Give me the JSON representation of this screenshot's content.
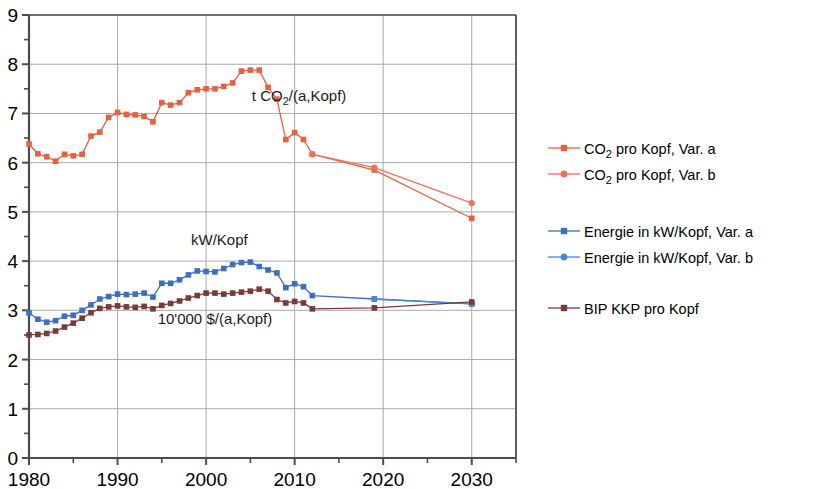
{
  "chart_data": {
    "type": "line",
    "title": "",
    "xlabel": "",
    "ylabel": "",
    "xlim": [
      1980,
      2035
    ],
    "ylim": [
      0,
      9
    ],
    "grid": true,
    "legend_position": "right",
    "x_ticks": [
      1980,
      1990,
      2000,
      2010,
      2020,
      2030
    ],
    "x_tick_labels": [
      "1980",
      "1990",
      "2000",
      "2010",
      "2020",
      "2030"
    ],
    "x_minor_ticks": [
      1985,
      1995,
      2005,
      2015,
      2025,
      2035
    ],
    "y_ticks": [
      0,
      1,
      2,
      3,
      4,
      5,
      6,
      7,
      8,
      9
    ],
    "y_tick_labels": [
      "0",
      "1",
      "2",
      "3",
      "4",
      "5",
      "6",
      "7",
      "8",
      "9"
    ],
    "y_minor_ticks": [
      0.5,
      1.5,
      2.5,
      3.5,
      4.5,
      5.5,
      6.5,
      7.5,
      8.5
    ],
    "annotations": [
      {
        "text": "t CO2/(a,Kopf)",
        "html": "t CO<sub>2</sub>/(a,Kopf)",
        "x": 2010.5,
        "y": 7.25
      },
      {
        "text": "kW/Kopf",
        "x": 2001.5,
        "y": 4.33
      },
      {
        "text": "10'000 $/(a,Kopf)",
        "x": 2001.0,
        "y": 2.72
      }
    ],
    "series": [
      {
        "name": "CO2 pro Kopf, Var. a",
        "color": "#e8603c",
        "marker": "square",
        "x": [
          1980,
          1981,
          1982,
          1983,
          1984,
          1985,
          1986,
          1987,
          1988,
          1989,
          1990,
          1991,
          1992,
          1993,
          1994,
          1995,
          1996,
          1997,
          1998,
          1999,
          2000,
          2001,
          2002,
          2003,
          2004,
          2005,
          2006,
          2007,
          2008,
          2009,
          2010,
          2011,
          2012,
          2019,
          2030
        ],
        "values": [
          6.38,
          6.18,
          6.12,
          6.03,
          6.17,
          6.14,
          6.17,
          6.54,
          6.62,
          6.92,
          7.02,
          6.98,
          6.97,
          6.94,
          6.83,
          7.22,
          7.17,
          7.22,
          7.42,
          7.48,
          7.5,
          7.5,
          7.55,
          7.62,
          7.86,
          7.88,
          7.88,
          7.53,
          7.29,
          6.47,
          6.61,
          6.47,
          6.17,
          5.85,
          4.87
        ]
      },
      {
        "name": "CO2 pro Kopf, Var. b",
        "color": "#f0705a",
        "marker": "circle",
        "x": [
          2012,
          2019,
          2030
        ],
        "values": [
          6.17,
          5.9,
          5.18
        ]
      },
      {
        "name": "Energie in kW/Kopf, Var. a",
        "color": "#3a6fc4",
        "marker": "square",
        "x": [
          1980,
          1981,
          1982,
          1983,
          1984,
          1985,
          1986,
          1987,
          1988,
          1989,
          1990,
          1991,
          1992,
          1993,
          1994,
          1995,
          1996,
          1997,
          1998,
          1999,
          2000,
          2001,
          2002,
          2003,
          2004,
          2005,
          2006,
          2007,
          2008,
          2009,
          2010,
          2011,
          2012,
          2019,
          2030
        ],
        "values": [
          2.95,
          2.82,
          2.76,
          2.79,
          2.88,
          2.9,
          3.0,
          3.11,
          3.23,
          3.28,
          3.33,
          3.32,
          3.33,
          3.35,
          3.27,
          3.55,
          3.55,
          3.62,
          3.72,
          3.8,
          3.79,
          3.78,
          3.85,
          3.93,
          3.97,
          3.98,
          3.89,
          3.82,
          3.76,
          3.46,
          3.54,
          3.48,
          3.3,
          3.23,
          3.13
        ]
      },
      {
        "name": "Energie in kW/Kopf, Var. b",
        "color": "#4a86d8",
        "marker": "circle",
        "x": [
          2019,
          2030
        ],
        "values": [
          3.23,
          3.13
        ]
      },
      {
        "name": "BIP KKP pro Kopf",
        "color": "#7a3a3a",
        "marker": "square",
        "x": [
          1980,
          1981,
          1982,
          1983,
          1984,
          1985,
          1986,
          1987,
          1988,
          1989,
          1990,
          1991,
          1992,
          1993,
          1994,
          1995,
          1996,
          1997,
          1998,
          1999,
          2000,
          2001,
          2002,
          2003,
          2004,
          2005,
          2006,
          2007,
          2008,
          2009,
          2010,
          2011,
          2012,
          2019,
          2030
        ],
        "values": [
          2.5,
          2.51,
          2.53,
          2.58,
          2.66,
          2.74,
          2.84,
          2.95,
          3.04,
          3.07,
          3.09,
          3.07,
          3.06,
          3.08,
          3.03,
          3.1,
          3.14,
          3.19,
          3.25,
          3.3,
          3.35,
          3.35,
          3.33,
          3.35,
          3.37,
          3.39,
          3.43,
          3.39,
          3.22,
          3.15,
          3.18,
          3.15,
          3.03,
          3.05,
          3.17
        ]
      }
    ]
  },
  "legend": {
    "entries": [
      {
        "label": "CO2 pro Kopf, Var. a",
        "prefix": "CO",
        "sub": "2",
        "suffix": " pro Kopf, Var. a",
        "color": "#e8603c",
        "marker": "square"
      },
      {
        "label": "CO2 pro Kopf, Var. b",
        "prefix": "CO",
        "sub": "2",
        "suffix": " pro Kopf, Var. b",
        "color": "#f0705a",
        "marker": "circle"
      },
      {
        "label": "Energie in kW/Kopf, Var. a",
        "prefix": "Energie in kW/Kopf, Var. a",
        "sub": "",
        "suffix": "",
        "color": "#3a6fc4",
        "marker": "square"
      },
      {
        "label": "Energie in kW/Kopf, Var. b",
        "prefix": "Energie in kW/Kopf, Var. b",
        "sub": "",
        "suffix": "",
        "color": "#4a86d8",
        "marker": "circle"
      },
      {
        "label": "BIP KKP pro Kopf",
        "prefix": "BIP KKP pro Kopf",
        "sub": "",
        "suffix": "",
        "color": "#7a3a3a",
        "marker": "square"
      }
    ]
  },
  "axis_colors": {
    "axis_line": "#4d4d4d",
    "grid_line": "#aaaaaa",
    "text": "#000000"
  }
}
